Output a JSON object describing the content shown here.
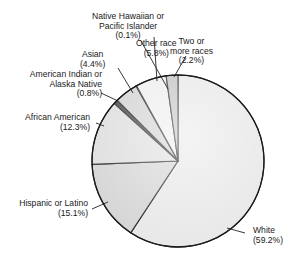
{
  "chart_data": {
    "type": "pie",
    "title": "",
    "start_angle_deg": 0,
    "direction": "clockwise",
    "slices": [
      {
        "label": "White",
        "value": 59.2,
        "display": "(59.2%)",
        "fill": "#e6e6e6"
      },
      {
        "label": "Hispanic or Latino",
        "value": 15.1,
        "display": "(15.1%)",
        "fill": "#d2d2d2"
      },
      {
        "label": "African American",
        "value": 12.3,
        "display": "(12.3%)",
        "fill": "#dcdcdc"
      },
      {
        "label": "American Indian or Alaska Native",
        "value": 0.8,
        "display": "(0.8%)",
        "fill": "#3a3a3a"
      },
      {
        "label": "Asian",
        "value": 4.4,
        "display": "(4.4%)",
        "fill": "#cfcfcf"
      },
      {
        "label": "Native Hawaiian or Pacific Islander",
        "value": 0.1,
        "display": "(0.1%)",
        "fill": "#111111"
      },
      {
        "label": "Other race",
        "value": 5.8,
        "display": "(5.8%)",
        "fill": "#ececec"
      },
      {
        "label": "Two or more races",
        "value": 2.2,
        "display": "(2.2%)",
        "fill": "#bdbdbd"
      }
    ],
    "legend": "none (direct labels with leader lines)"
  },
  "labels": {
    "white": {
      "line1": "White",
      "line2": "(59.2%)"
    },
    "hispanic": {
      "line1": "Hispanic or Latino",
      "line2": "(15.1%)"
    },
    "african": {
      "line1": "African American",
      "line2": "(12.3%)"
    },
    "amind": {
      "line1": "American Indian or",
      "line2": "Alaska Native",
      "line3": "(0.8%)"
    },
    "asian": {
      "line1": "Asian",
      "line2": "(4.4%)"
    },
    "nhpi": {
      "line1": "Native Hawaiian or",
      "line2": "Pacific Islander",
      "line3": "(0.1%)"
    },
    "other": {
      "line1": "Other race",
      "line2": "(5.8%)"
    },
    "two": {
      "line1": "Two or",
      "line2": "more races",
      "line3": "(2.2%)"
    }
  }
}
